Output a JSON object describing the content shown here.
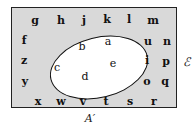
{
  "diagram": {
    "type": "venn",
    "universal_set_label": "ℰ",
    "shaded_region_label": "A′",
    "colors": {
      "shaded": "#d9d9d9",
      "set_interior": "#ffffff",
      "border": "#222222"
    },
    "set_A_elements": [
      {
        "t": "b",
        "x": 82,
        "y": 46
      },
      {
        "t": "a",
        "x": 108,
        "y": 41
      },
      {
        "t": "c",
        "x": 57,
        "y": 67
      },
      {
        "t": "e",
        "x": 113,
        "y": 63
      },
      {
        "t": "d",
        "x": 85,
        "y": 76
      }
    ],
    "complement_elements": [
      {
        "t": "g",
        "x": 35,
        "y": 20
      },
      {
        "t": "h",
        "x": 61,
        "y": 20
      },
      {
        "t": "j",
        "x": 84,
        "y": 20
      },
      {
        "t": "k",
        "x": 107,
        "y": 19
      },
      {
        "t": "l",
        "x": 129,
        "y": 19
      },
      {
        "t": "m",
        "x": 153,
        "y": 20
      },
      {
        "t": "f",
        "x": 24,
        "y": 40
      },
      {
        "t": "u",
        "x": 148,
        "y": 41
      },
      {
        "t": "n",
        "x": 167,
        "y": 41
      },
      {
        "t": "z",
        "x": 24,
        "y": 60
      },
      {
        "t": "i",
        "x": 147,
        "y": 60
      },
      {
        "t": "p",
        "x": 166,
        "y": 61
      },
      {
        "t": "y",
        "x": 25,
        "y": 81
      },
      {
        "t": "o",
        "x": 147,
        "y": 81
      },
      {
        "t": "q",
        "x": 165,
        "y": 81
      },
      {
        "t": "x",
        "x": 38,
        "y": 101
      },
      {
        "t": "w",
        "x": 61,
        "y": 101
      },
      {
        "t": "v",
        "x": 83,
        "y": 101
      },
      {
        "t": "t",
        "x": 106,
        "y": 101
      },
      {
        "t": "s",
        "x": 130,
        "y": 101
      },
      {
        "t": "r",
        "x": 154,
        "y": 101
      }
    ]
  }
}
